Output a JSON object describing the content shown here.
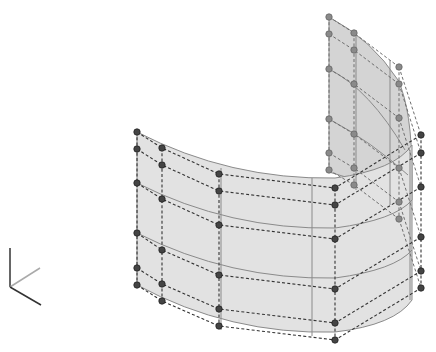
{
  "scene": {
    "description": "3D NURBS surface (curved wall) with control-point cage",
    "colors": {
      "background": "#ffffff",
      "surface_fill": "#e2e2e2",
      "surface_edge": "#8a8a8a",
      "control_point": "#444444",
      "control_cage": "#333333"
    },
    "axes": {
      "origin": [
        10,
        287
      ],
      "z_end": [
        10,
        248
      ],
      "x_end": [
        40,
        268
      ],
      "y_end": [
        41,
        305
      ],
      "colors": {
        "z": "#333333",
        "x": "#aaaaaa",
        "y": "#333333"
      }
    },
    "control_columns_front": [
      {
        "x": 137,
        "ys": [
          132,
          149,
          183,
          233,
          268,
          285
        ]
      },
      {
        "x": 162,
        "ys": [
          148,
          165,
          199,
          250,
          284,
          301
        ]
      },
      {
        "x": 219,
        "ys": [
          174,
          191,
          225,
          275,
          309,
          326
        ]
      },
      {
        "x": 335,
        "ys": [
          188,
          205,
          239,
          289,
          323,
          340
        ]
      },
      {
        "x": 421,
        "ys": [
          135,
          153,
          187,
          237,
          271,
          288
        ]
      }
    ],
    "control_columns_back": [
      {
        "x": 329,
        "ys": [
          17,
          34,
          69,
          119,
          153,
          170
        ]
      },
      {
        "x": 354,
        "ys": [
          33,
          50,
          84,
          134,
          168,
          185
        ]
      },
      {
        "x": 399,
        "ys": [
          67,
          84,
          118,
          168,
          202,
          219
        ]
      }
    ]
  }
}
